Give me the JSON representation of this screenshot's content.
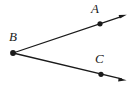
{
  "figure": {
    "type": "geometry-diagram",
    "background_color": "#ffffff",
    "stroke_color": "#1a1a1a",
    "width": 135,
    "height": 89,
    "labels": {
      "a": "A",
      "b": "B",
      "c": "C"
    },
    "points": [
      {
        "name": "A",
        "x": 100,
        "y": 24,
        "label": "A",
        "label_x": 91,
        "label_y": 2
      },
      {
        "name": "B",
        "x": 13,
        "y": 53,
        "label": "B",
        "label_x": 9,
        "label_y": 30
      },
      {
        "name": "C",
        "x": 101,
        "y": 74,
        "label": "C",
        "label_x": 95,
        "label_y": 52
      }
    ],
    "rays": [
      {
        "name": "ray-BA",
        "from": "B",
        "through": "A",
        "x1": 13,
        "y1": 53,
        "x2": 126,
        "y2": 15,
        "arrow_at_end": true
      },
      {
        "name": "ray-BC",
        "from": "B",
        "through": "C",
        "x1": 13,
        "y1": 53,
        "x2": 126,
        "y2": 80,
        "arrow_at_end": true
      }
    ],
    "dot_radius": 2.6,
    "line_width": 1.3
  }
}
